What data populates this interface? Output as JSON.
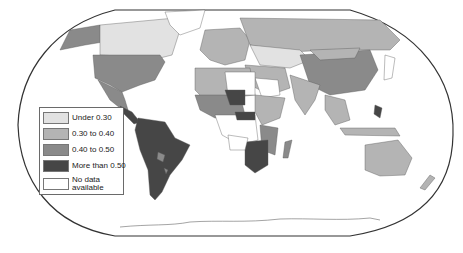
{
  "map": {
    "projection": "world (Robinson-like) choropleth",
    "colors": {
      "under_0_30": "#e2e2e2",
      "0_30_to_0_40": "#b4b4b4",
      "0_40_to_0_50": "#8a8a8a",
      "more_than_0_50": "#464646",
      "no_data": "#ffffff",
      "border": "#333333"
    }
  },
  "legend": {
    "items": [
      {
        "label": "Under 0.30",
        "color": "#e2e2e2"
      },
      {
        "label": "0.30 to 0.40",
        "color": "#b4b4b4"
      },
      {
        "label": "0.40 to 0.50",
        "color": "#8a8a8a"
      },
      {
        "label": "More than 0.50",
        "color": "#464646"
      },
      {
        "label": "No data available",
        "color": "#ffffff"
      }
    ]
  }
}
